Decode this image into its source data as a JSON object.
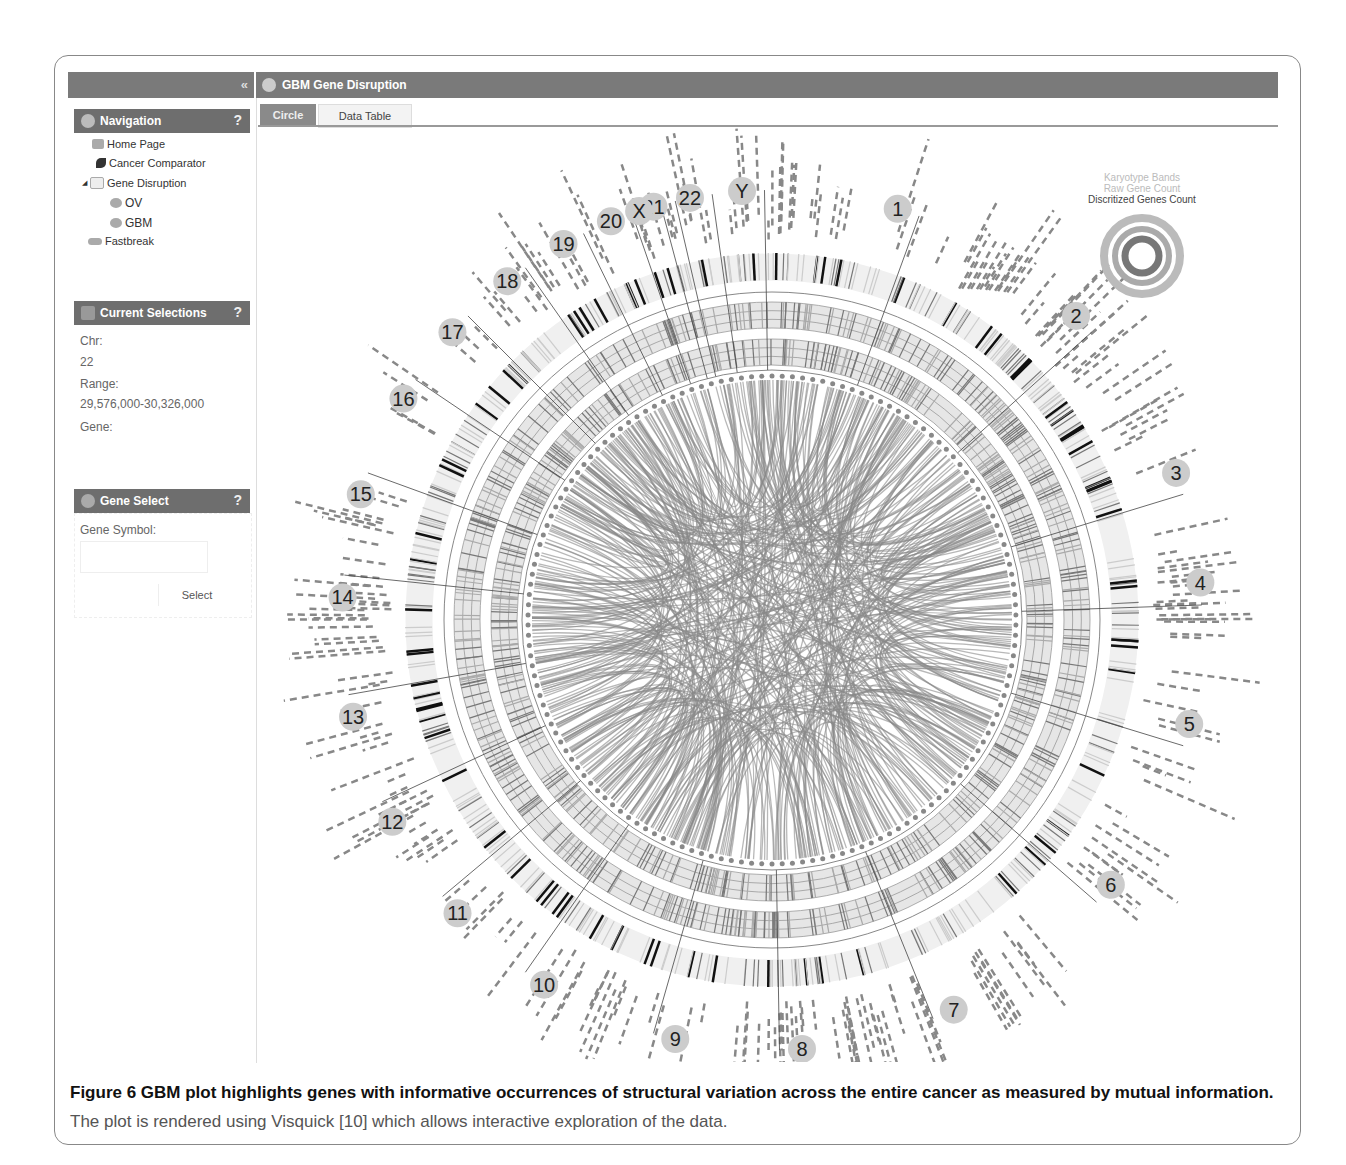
{
  "app": {
    "title": "GBM Gene Disruption",
    "collapse_icon": "double-chevron-left-icon"
  },
  "tabs": [
    {
      "label": "Circle",
      "active": true
    },
    {
      "label": "Data Table",
      "active": false
    }
  ],
  "navigation": {
    "title": "Navigation",
    "help": "?",
    "items": [
      {
        "label": "Home Page",
        "icon": "home-icon",
        "indent": 0
      },
      {
        "label": "Cancer Comparator",
        "icon": "leaf-icon",
        "indent": 0
      },
      {
        "label": "Gene Disruption",
        "icon": "folder-icon",
        "indent": 0,
        "expanded": true
      },
      {
        "label": "OV",
        "icon": "chart-icon",
        "indent": 1
      },
      {
        "label": "GBM",
        "icon": "chart-icon",
        "indent": 1
      },
      {
        "label": "Fastbreak",
        "icon": "link-icon",
        "indent": 0
      }
    ]
  },
  "current_selections": {
    "title": "Current Selections",
    "help": "?",
    "chr_label": "Chr:",
    "chr_value": "22",
    "range_label": "Range:",
    "range_value": "29,576,000-30,326,000",
    "gene_label": "Gene:",
    "gene_value": ""
  },
  "gene_select": {
    "title": "Gene Select",
    "help": "?",
    "symbol_label": "Gene Symbol:",
    "input_value": "",
    "button": "Select"
  },
  "legend": {
    "items": [
      "Karyotype Bands",
      "Raw Gene Count",
      "Discritized Genes Count"
    ],
    "colors": [
      "#b0b0b0",
      "#a0a0a0",
      "#444444"
    ]
  },
  "chart_data": {
    "type": "circos",
    "title": "GBM Gene Disruption",
    "chromosomes": [
      "1",
      "2",
      "3",
      "4",
      "5",
      "6",
      "7",
      "8",
      "9",
      "10",
      "11",
      "12",
      "13",
      "14",
      "15",
      "16",
      "17",
      "18",
      "19",
      "20",
      "21",
      "22",
      "X",
      "Y"
    ],
    "tracks": [
      "Karyotype Bands",
      "Raw Gene Count",
      "Discritized Genes Count",
      "structural variation links (mutual information)"
    ],
    "selection": {
      "chr": "22",
      "range": "29,576,000-30,326,000"
    }
  },
  "caption": {
    "label": "Figure 6",
    "bold": " GBM plot highlights genes with informative occurrences of structural variation across the entire cancer as measured by mutual information.",
    "rest": " The plot is rendered using Visquick [10] which allows interactive exploration of the data."
  }
}
